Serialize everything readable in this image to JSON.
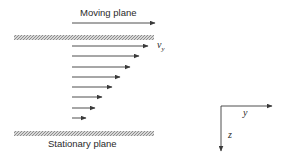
{
  "diagram": {
    "top_label": "Moving plane",
    "bottom_label": "Stationary plane",
    "velocity_label": "v",
    "velocity_subscript": "y",
    "axis_y_label": "y",
    "axis_z_label": "z",
    "colors": {
      "line": "#3a3a3a",
      "hatch": "#8a8a8a",
      "text": "#2a2a2a"
    },
    "velocity_arrows": [
      {
        "y": 46,
        "x_start": 72,
        "x_end": 148
      },
      {
        "y": 56,
        "x_start": 72,
        "x_end": 139
      },
      {
        "y": 67,
        "x_start": 72,
        "x_end": 130
      },
      {
        "y": 77,
        "x_start": 72,
        "x_end": 120
      },
      {
        "y": 87,
        "x_start": 72,
        "x_end": 112
      },
      {
        "y": 97,
        "x_start": 72,
        "x_end": 102
      },
      {
        "y": 108,
        "x_start": 72,
        "x_end": 95
      },
      {
        "y": 118,
        "x_start": 72,
        "x_end": 86
      }
    ]
  }
}
